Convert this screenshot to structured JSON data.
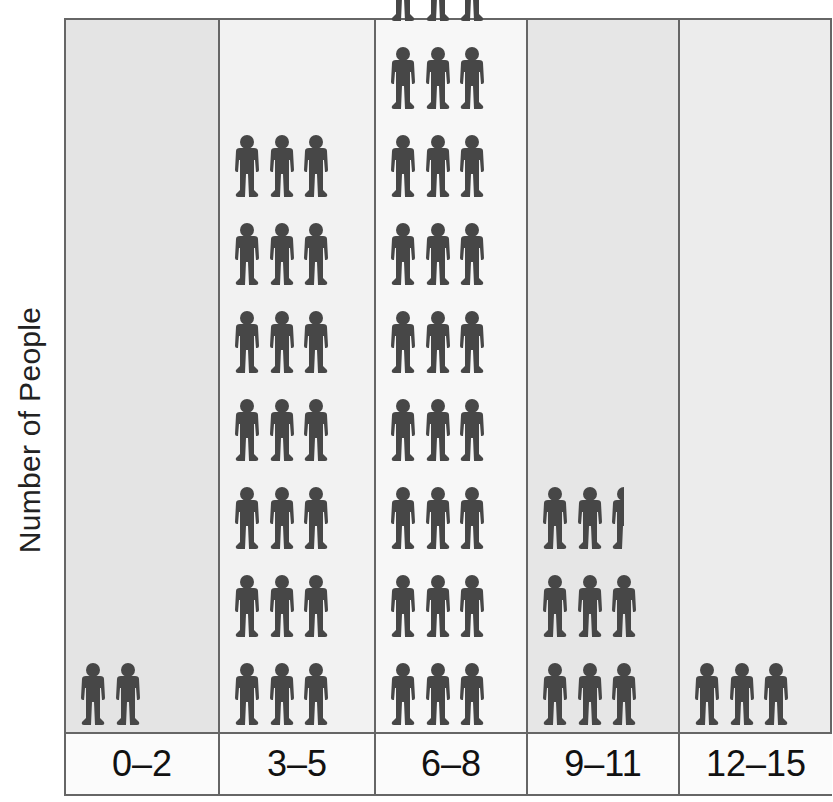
{
  "chart_data": {
    "type": "bar",
    "subtype": "pictograph",
    "title": "",
    "xlabel": "",
    "ylabel": "Number of People",
    "categories": [
      "0–2",
      "3–5",
      "6–8",
      "9–11",
      "12–15"
    ],
    "values": [
      2,
      21,
      32,
      8.5,
      3
    ],
    "icon": "person-icon",
    "icons_per_row": 4,
    "column_backgrounds": [
      "#e4e4e4",
      "#f2f2f2",
      "#f7f7f7",
      "#e6e6e6",
      "#ececec"
    ],
    "icon_color": "#474747",
    "grid": true
  },
  "axis": {
    "ylabel": "Number of People"
  },
  "columns": [
    {
      "label": "0–2",
      "count": 2
    },
    {
      "label": "3–5",
      "count": 21
    },
    {
      "label": "6–8",
      "count": 32
    },
    {
      "label": "9–11",
      "count": 8.5
    },
    {
      "label": "12–15",
      "count": 3
    }
  ]
}
